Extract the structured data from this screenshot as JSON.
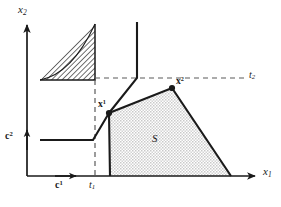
{
  "figure": {
    "background_color": "#ffffff",
    "line_color": "#1a1a1a",
    "fill_color": "#d8d8d8",
    "hatch_color": "#3a3a3a",
    "width": 281,
    "height": 207
  },
  "axes": {
    "x_axis": {
      "label": "x",
      "subscript": "1",
      "origin_px": [
        27,
        176
      ],
      "end_px": [
        258,
        176
      ],
      "direction": "right"
    },
    "y_axis": {
      "label": "x",
      "subscript": "2",
      "origin_px": [
        27,
        176
      ],
      "end_px": [
        27,
        22
      ],
      "direction": "up"
    }
  },
  "threshold_lines": [
    {
      "name": "t1",
      "label": "t",
      "subscript": "1",
      "orientation": "vertical",
      "style": "dashed",
      "x_px": 95,
      "from_px": [
        95,
        80
      ],
      "to_px": [
        95,
        176
      ]
    },
    {
      "name": "t2",
      "label": "t",
      "subscript": "2",
      "orientation": "horizontal",
      "style": "dashed",
      "y_px": 78,
      "from_px": [
        95,
        78
      ],
      "to_px": [
        245,
        78
      ]
    }
  ],
  "cost_vectors": [
    {
      "name": "c1",
      "label": "c",
      "superscript": "1",
      "direction": "right",
      "arrow_from_px": [
        55,
        176
      ],
      "arrow_to_px": [
        79,
        176
      ],
      "label_px": [
        55,
        180
      ]
    },
    {
      "name": "c2",
      "label": "c",
      "superscript": "2",
      "direction": "up",
      "arrow_from_px": [
        27,
        150
      ],
      "arrow_to_px": [
        27,
        128
      ],
      "label_px": [
        5,
        131
      ]
    }
  ],
  "hatched_triangle": {
    "name": "hatched-region",
    "description": "hatched right triangle above t2 and left of t1",
    "vertices_px": [
      [
        40,
        80
      ],
      [
        95,
        80
      ],
      [
        95,
        24
      ]
    ],
    "hatch_angle_deg": 45,
    "hatch_spacing_px": 2.6
  },
  "feasible_region": {
    "name": "region-S",
    "label": "S",
    "label_px": [
      152,
      133
    ],
    "fill": "stipple-gray",
    "vertices_px": [
      [
        109,
        113
      ],
      [
        172,
        88
      ],
      [
        231,
        176
      ],
      [
        110,
        176
      ]
    ]
  },
  "marked_points": [
    {
      "name": "x1",
      "label": "x",
      "superscript": "1",
      "position_px": [
        109,
        113
      ],
      "label_px": [
        98,
        99
      ],
      "marker": "filled-dot"
    },
    {
      "name": "x2",
      "label": "x",
      "superscript": "2",
      "position_px": [
        172,
        88
      ],
      "label_px": [
        176,
        76
      ],
      "marker": "filled-dot"
    }
  ],
  "boundary_paths": [
    {
      "name": "lower-left-staircase",
      "description": "horizontal segment at c2 level then diagonal rise to x1",
      "points_px": [
        [
          40,
          140
        ],
        [
          93,
          140
        ],
        [
          109,
          113
        ]
      ]
    },
    {
      "name": "upper-vertical-branch",
      "description": "vertical line descending to t2 level then diagonal down-left to x1",
      "points_px": [
        [
          137,
          22
        ],
        [
          137,
          78
        ],
        [
          109,
          113
        ]
      ]
    }
  ]
}
